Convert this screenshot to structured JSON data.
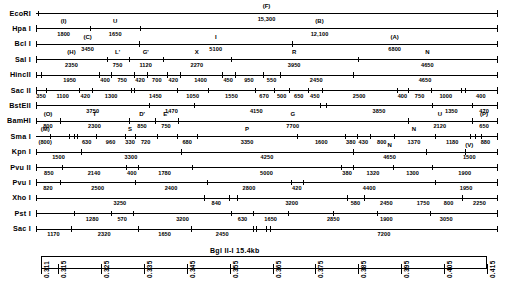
{
  "figure": {
    "kind": "restriction-enzyme-map",
    "left_axis_x": 36,
    "right_axis_x": 497,
    "first_row_y": 13,
    "row_pitch": 15.4,
    "total_length": 15400
  },
  "ruler": {
    "title": "Bgl II-I    15.4kb",
    "title_parts": {
      "enzyme": "Bgl II-I",
      "size": "15.4kb"
    },
    "ticks": [
      "0.311",
      "0.315",
      "0.325",
      "0.335",
      "0.345",
      "0.355",
      "0.365",
      "0.375",
      "0.385",
      "0.395",
      "0.405",
      "0.415"
    ],
    "tick_positions": [
      0.0,
      0.0385,
      0.1346,
      0.2308,
      0.3269,
      0.4231,
      0.5192,
      0.6154,
      0.7115,
      0.8077,
      0.9038,
      1.0
    ]
  },
  "rows": [
    {
      "enzyme": "EcoRI",
      "sites": [
        0.004,
        1.0
      ],
      "fragments": [
        {
          "name": "(F)",
          "size": "15,300",
          "center": 0.5
        }
      ]
    },
    {
      "enzyme": "Hpa I",
      "sites": [
        0.0,
        0.118,
        0.225,
        1.0
      ],
      "fragments": [
        {
          "name": "(I)",
          "size": "1800",
          "center": 0.06
        },
        {
          "name": "U",
          "size": "1650",
          "center": 0.172
        },
        {
          "name": "(B)",
          "size": "12,100",
          "center": 0.615
        }
      ]
    },
    {
      "enzyme": "Bcl I",
      "sites": [
        0.0,
        0.224,
        0.555,
        1.0
      ],
      "fragments": [
        {
          "name": "(C)",
          "size": "3450",
          "center": 0.112
        },
        {
          "name": "I",
          "size": "5100",
          "center": 0.39
        },
        {
          "name": "(A)",
          "size": "6800",
          "center": 0.778
        }
      ]
    },
    {
      "enzyme": "Sal I",
      "sites": [
        0.0,
        0.153,
        0.202,
        0.275,
        0.423,
        0.698,
        1.0
      ],
      "fragments": [
        {
          "name": "(H)",
          "size": "2350",
          "center": 0.077
        },
        {
          "name": "L'",
          "size": "750",
          "center": 0.177
        },
        {
          "name": "G'",
          "size": "1120",
          "center": 0.238
        },
        {
          "name": "X",
          "size": "2270",
          "center": 0.349
        },
        {
          "name": "R",
          "size": "3950",
          "center": 0.56
        },
        {
          "name": "N",
          "size": "4650",
          "center": 0.849
        }
      ]
    },
    {
      "enzyme": "HincII",
      "sites": [
        0.0,
        0.01,
        0.137,
        0.163,
        0.212,
        0.24,
        0.285,
        0.312,
        0.403,
        0.432,
        0.493,
        0.529,
        0.688,
        1.0
      ],
      "fragments": [
        {
          "size": "1950",
          "center": 0.073
        },
        {
          "size": "400",
          "center": 0.15
        },
        {
          "size": "750",
          "center": 0.187
        },
        {
          "size": "420",
          "center": 0.226
        },
        {
          "size": "700",
          "center": 0.262
        },
        {
          "size": "420",
          "center": 0.298
        },
        {
          "size": "1400",
          "center": 0.357
        },
        {
          "size": "450",
          "center": 0.417
        },
        {
          "size": "950",
          "center": 0.462
        },
        {
          "size": "550",
          "center": 0.511
        },
        {
          "size": "2450",
          "center": 0.608
        },
        {
          "size": "4650",
          "center": 0.844
        }
      ]
    },
    {
      "enzyme": "Sac II",
      "sites": [
        0.0,
        0.022,
        0.094,
        0.121,
        0.205,
        0.212,
        0.306,
        0.374,
        0.474,
        0.517,
        0.549,
        0.591,
        0.62,
        0.782,
        0.808,
        0.857,
        0.922,
        0.93,
        1.0
      ],
      "fragments": [
        {
          "size": "350",
          "center": 0.011
        },
        {
          "size": "1100",
          "center": 0.058
        },
        {
          "size": "420",
          "center": 0.107
        },
        {
          "size": "1300",
          "center": 0.163
        },
        {
          "size": "1450",
          "center": 0.259
        },
        {
          "size": "1050",
          "center": 0.34
        },
        {
          "size": "1550",
          "center": 0.424
        },
        {
          "size": "670",
          "center": 0.495
        },
        {
          "size": "500",
          "center": 0.533
        },
        {
          "size": "650",
          "center": 0.57
        },
        {
          "size": "450",
          "center": 0.605
        },
        {
          "size": "2500",
          "center": 0.701
        },
        {
          "size": "400",
          "center": 0.795
        },
        {
          "size": "750",
          "center": 0.832
        },
        {
          "size": "1000",
          "center": 0.889
        },
        {
          "size": "400",
          "center": 0.965
        }
      ]
    },
    {
      "enzyme": "BstEII",
      "sites": [
        0.0,
        0.246,
        0.342,
        0.615,
        0.63,
        0.858,
        0.945,
        1.0
      ],
      "fragments": [
        {
          "size": "3750",
          "center": 0.123
        },
        {
          "size": "1470",
          "center": 0.294
        },
        {
          "size": "4150",
          "center": 0.478
        },
        {
          "size": "3850",
          "center": 0.744
        },
        {
          "size": "1350",
          "center": 0.901
        },
        {
          "size": "470",
          "center": 0.972
        }
      ]
    },
    {
      "enzyme": "BamHI",
      "sites": [
        0.0,
        0.052,
        0.202,
        0.258,
        0.307,
        0.808,
        0.945,
        1.0
      ],
      "fragments": [
        {
          "name": "(O)",
          "size": "800",
          "center": 0.026
        },
        {
          "name": "T",
          "size": "2300",
          "center": 0.127
        },
        {
          "name": "D'",
          "size": "850",
          "center": 0.23
        },
        {
          "name": "E'",
          "size": "750",
          "center": 0.282
        },
        {
          "name": "G",
          "size": "7700",
          "center": 0.557
        },
        {
          "name": "U",
          "size": "2120",
          "center": 0.876
        },
        {
          "name": "(P)",
          "size": "650",
          "center": 0.972
        }
      ]
    },
    {
      "enzyme": "Sma I",
      "sites": [
        0.03,
        0.071,
        0.082,
        0.09,
        0.131,
        0.193,
        0.215,
        0.262,
        0.306,
        0.35,
        0.567,
        0.671,
        0.696,
        0.724,
        0.776,
        0.865,
        0.941,
        0.953,
        0.965,
        1.0
      ],
      "fragments": [
        {
          "name": "(M)",
          "size": "(800)",
          "center": 0.02
        },
        {
          "size": "630",
          "center": 0.11
        },
        {
          "size": "960",
          "center": 0.162
        },
        {
          "name": "S",
          "size": "330",
          "center": 0.204
        },
        {
          "size": "720",
          "center": 0.238
        },
        {
          "size": "680",
          "center": 0.328
        },
        {
          "name": "P",
          "size": "3350",
          "center": 0.458
        },
        {
          "size": "1600",
          "center": 0.619
        },
        {
          "size": "380",
          "center": 0.683
        },
        {
          "size": "430",
          "center": 0.71
        },
        {
          "size": "800",
          "center": 0.75
        },
        {
          "name": "N",
          "size": "1370",
          "center": 0.82
        },
        {
          "size": "1180",
          "center": 0.903
        },
        {
          "size": "880",
          "center": 0.975
        }
      ]
    },
    {
      "enzyme": "Kpn I",
      "sites": [
        0.0,
        0.098,
        0.314,
        0.688,
        0.847,
        0.93,
        1.0
      ],
      "fragments": [
        {
          "size": "1500",
          "center": 0.049
        },
        {
          "size": "3300",
          "center": 0.206
        },
        {
          "size": "4250",
          "center": 0.501
        },
        {
          "name": "N",
          "size": "4650",
          "center": 0.767
        },
        {
          "name": "(V)",
          "size": "1500",
          "center": 0.94
        }
      ]
    },
    {
      "enzyme": "Pvu II",
      "sites": [
        0.0,
        0.056,
        0.196,
        0.222,
        0.338,
        0.662,
        0.687,
        0.775,
        0.859,
        1.0
      ],
      "fragments": [
        {
          "size": "850",
          "center": 0.028
        },
        {
          "size": "2140",
          "center": 0.126
        },
        {
          "size": "400",
          "center": 0.208
        },
        {
          "size": "1780",
          "center": 0.279
        },
        {
          "size": "5000",
          "center": 0.5
        },
        {
          "size": "380",
          "center": 0.675
        },
        {
          "size": "1320",
          "center": 0.731
        },
        {
          "size": "1300",
          "center": 0.817
        },
        {
          "size": "1900",
          "center": 0.93
        }
      ]
    },
    {
      "enzyme": "Pvu I",
      "sites": [
        0.0,
        0.053,
        0.215,
        0.371,
        0.553,
        0.58,
        0.866,
        1.0
      ],
      "fragments": [
        {
          "size": "820",
          "center": 0.026
        },
        {
          "size": "2500",
          "center": 0.134
        },
        {
          "size": "2400",
          "center": 0.293
        },
        {
          "size": "2800",
          "center": 0.462
        },
        {
          "size": "420",
          "center": 0.566
        },
        {
          "size": "4400",
          "center": 0.723
        },
        {
          "size": "1950",
          "center": 0.933
        }
      ]
    },
    {
      "enzyme": "Xho I",
      "sites": [
        0.0,
        0.364,
        0.418,
        0.435,
        0.674,
        0.712,
        0.925,
        1.0
      ],
      "fragments": [
        {
          "size": "3250",
          "center": 0.182
        },
        {
          "size": "840",
          "center": 0.391
        },
        {
          "size": "3200",
          "center": 0.555
        },
        {
          "size": "580",
          "center": 0.693
        },
        {
          "size": "2450",
          "center": 0.76
        },
        {
          "size": "1750",
          "center": 0.84
        },
        {
          "size": "800",
          "center": 0.895
        },
        {
          "size": "2250",
          "center": 0.962
        }
      ]
    },
    {
      "enzyme": "Pst I",
      "sites": [
        0.0,
        0.083,
        0.163,
        0.211,
        0.424,
        0.471,
        0.546,
        0.645,
        0.74,
        0.855,
        1.0
      ],
      "fragments": [
        {
          "size": "1280",
          "center": 0.122
        },
        {
          "size": "570",
          "center": 0.187
        },
        {
          "size": "3200",
          "center": 0.318
        },
        {
          "size": "630",
          "center": 0.448
        },
        {
          "size": "1650",
          "center": 0.509
        },
        {
          "size": "2850",
          "center": 0.645
        },
        {
          "size": "1900",
          "center": 0.76
        },
        {
          "size": "3050",
          "center": 0.89
        }
      ]
    },
    {
      "enzyme": "Sac I",
      "sites": [
        0.0,
        0.076,
        0.221,
        0.337,
        0.47,
        0.478,
        0.499,
        0.508,
        1.0
      ],
      "fragments": [
        {
          "size": "1170",
          "center": 0.038
        },
        {
          "size": "2320",
          "center": 0.148
        },
        {
          "size": "1650",
          "center": 0.279
        },
        {
          "size": "2450",
          "center": 0.404
        },
        {
          "size": "7200",
          "center": 0.755
        }
      ]
    }
  ]
}
